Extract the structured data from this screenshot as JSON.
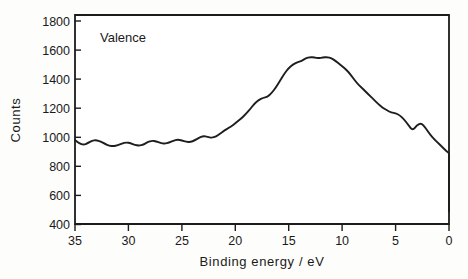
{
  "chart_data": {
    "type": "line",
    "title": "",
    "annotation": "Valence",
    "xlabel": "Binding energy / eV",
    "ylabel": "Counts",
    "xlim": [
      35,
      0
    ],
    "ylim": [
      350,
      1850
    ],
    "x_reversed": true,
    "grid": false,
    "legend": "none",
    "xticks": [
      35,
      30,
      25,
      20,
      15,
      10,
      5,
      0
    ],
    "xtick_labels": [
      "35",
      "30",
      "25",
      "20",
      "15",
      "10",
      "5",
      "0"
    ],
    "yticks": [
      400,
      600,
      800,
      1000,
      1200,
      1400,
      1600,
      1800
    ],
    "ytick_labels": [
      "400",
      "600",
      "800",
      "1000",
      "1200",
      "1400",
      "1600",
      "1800"
    ],
    "series": [
      {
        "name": "Valence band spectrum",
        "color": "#1e1e1e",
        "x": [
          35.0,
          34.6,
          34.2,
          33.8,
          33.4,
          33.0,
          32.6,
          32.2,
          31.8,
          31.4,
          31.0,
          30.6,
          30.2,
          29.8,
          29.4,
          29.0,
          28.6,
          28.2,
          27.8,
          27.4,
          27.0,
          26.6,
          26.2,
          25.8,
          25.4,
          25.0,
          24.6,
          24.2,
          23.8,
          23.4,
          23.0,
          22.6,
          22.2,
          21.8,
          21.4,
          21.0,
          20.6,
          20.2,
          19.8,
          19.4,
          19.0,
          18.6,
          18.2,
          17.8,
          17.4,
          17.0,
          16.6,
          16.2,
          15.8,
          15.4,
          15.0,
          14.6,
          14.2,
          13.8,
          13.4,
          13.0,
          12.6,
          12.2,
          11.8,
          11.4,
          11.0,
          10.6,
          10.2,
          9.8,
          9.4,
          9.0,
          8.6,
          8.2,
          7.8,
          7.4,
          7.0,
          6.6,
          6.2,
          5.8,
          5.4,
          5.0,
          4.6,
          4.2,
          3.8,
          3.4,
          3.0,
          2.6,
          2.2,
          1.8,
          1.4,
          1.0,
          0.6,
          0.2,
          0.0
        ],
        "y": [
          952,
          930,
          918,
          930,
          948,
          952,
          942,
          925,
          912,
          908,
          915,
          928,
          936,
          930,
          918,
          912,
          920,
          938,
          948,
          944,
          932,
          926,
          934,
          948,
          956,
          950,
          940,
          938,
          950,
          968,
          982,
          975,
          968,
          978,
          1000,
          1022,
          1040,
          1060,
          1085,
          1110,
          1140,
          1175,
          1215,
          1240,
          1255,
          1262,
          1290,
          1330,
          1380,
          1430,
          1470,
          1495,
          1510,
          1520,
          1540,
          1548,
          1545,
          1540,
          1545,
          1548,
          1540,
          1520,
          1495,
          1470,
          1440,
          1400,
          1360,
          1330,
          1300,
          1270,
          1240,
          1210,
          1185,
          1165,
          1150,
          1145,
          1130,
          1100,
          1060,
          1020,
          1060,
          1075,
          1040,
          995,
          960,
          930,
          900,
          870,
          860
        ],
        "y_tail": [
          840,
          810,
          790,
          780,
          765,
          740,
          720,
          700,
          690,
          680,
          670,
          655,
          640,
          625,
          615,
          600,
          590,
          585,
          575,
          560,
          548,
          540,
          530,
          520,
          512,
          505,
          498,
          490,
          482,
          478,
          470,
          462,
          458,
          452,
          448,
          444,
          442,
          440,
          440
        ]
      }
    ]
  },
  "plot": {
    "frame_color": "#1b1b1b",
    "background": "#ffffff"
  }
}
